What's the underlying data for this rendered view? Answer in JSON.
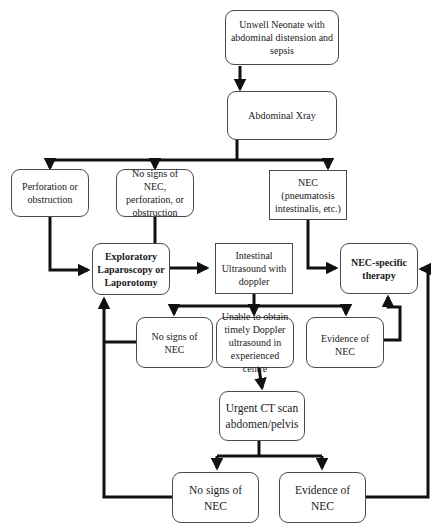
{
  "diagram": {
    "type": "flowchart",
    "colors": {
      "line": "#111111",
      "box_border": "#4a4a4a",
      "background": "#ffffff"
    },
    "nodes": {
      "start": {
        "label": "Unwell Neonate with abdominal distension and sepsis",
        "shape": "rounded"
      },
      "xray": {
        "label": "Abdominal Xray",
        "shape": "rounded"
      },
      "perforation": {
        "label": "Perforation or obstruction",
        "shape": "rounded"
      },
      "no_signs_xray": {
        "label": "No signs of NEC, perforation, or obstruction",
        "shape": "rounded"
      },
      "nec_xray": {
        "label": "NEC (pneumatosis intestinalis, etc.)",
        "shape": "square"
      },
      "laparotomy": {
        "label": "Exploratory Laparoscopy or Laporotomy",
        "shape": "rounded",
        "bold": true
      },
      "ultrasound": {
        "label": "Intestinal Ultrasound with doppler",
        "shape": "square"
      },
      "nec_therapy": {
        "label": "NEC-specific therapy",
        "shape": "rounded",
        "bold": true
      },
      "no_signs_us": {
        "label": "No signs of NEC",
        "shape": "rounded"
      },
      "unable_doppler": {
        "label": "Unable to obtain timely Doppler ultrasound in experienced centre",
        "shape": "rounded"
      },
      "evidence_us": {
        "label": "Evidence of NEC",
        "shape": "rounded"
      },
      "ct_scan": {
        "label": "Urgent CT scan abdomen/pelvis",
        "shape": "rounded"
      },
      "no_signs_ct": {
        "label": "No signs of NEC",
        "shape": "rounded"
      },
      "evidence_ct": {
        "label": "Evidence of NEC",
        "shape": "rounded"
      }
    },
    "edges": [
      {
        "from": "start",
        "to": "xray"
      },
      {
        "from": "xray",
        "to": "perforation"
      },
      {
        "from": "xray",
        "to": "no_signs_xray"
      },
      {
        "from": "xray",
        "to": "nec_xray"
      },
      {
        "from": "perforation",
        "to": "laparotomy"
      },
      {
        "from": "no_signs_xray",
        "to": "ultrasound"
      },
      {
        "from": "nec_xray",
        "to": "nec_therapy"
      },
      {
        "from": "ultrasound",
        "to": "no_signs_us"
      },
      {
        "from": "ultrasound",
        "to": "unable_doppler"
      },
      {
        "from": "ultrasound",
        "to": "evidence_us"
      },
      {
        "from": "evidence_us",
        "to": "nec_therapy"
      },
      {
        "from": "no_signs_us",
        "to": "laparotomy"
      },
      {
        "from": "unable_doppler",
        "to": "ct_scan"
      },
      {
        "from": "ct_scan",
        "to": "no_signs_ct"
      },
      {
        "from": "ct_scan",
        "to": "evidence_ct"
      },
      {
        "from": "no_signs_ct",
        "to": "laparotomy"
      },
      {
        "from": "evidence_ct",
        "to": "nec_therapy"
      }
    ]
  }
}
